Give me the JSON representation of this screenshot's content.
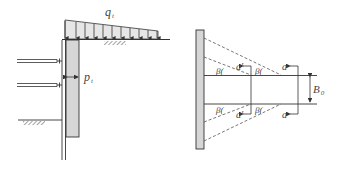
{
  "left_figure": {
    "surcharge_label": "q",
    "surcharge_sub": "t",
    "pressure_label": "p",
    "pressure_sub": "t",
    "arrow_count": 12
  },
  "right_figure": {
    "angle_label": "β",
    "a_label": "a",
    "a_prime_label": "a′",
    "width_label": "B",
    "width_sub": "0"
  },
  "colors": {
    "line": "#333333",
    "panel_fill": "#d6d6d6",
    "load_fill": "#e4e4e4",
    "dashed": "#555555"
  }
}
